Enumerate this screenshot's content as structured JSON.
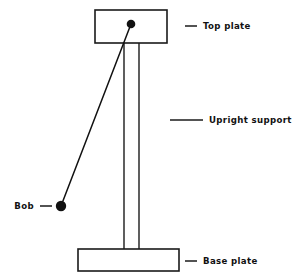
{
  "diagram": {
    "background_color": "#ffffff",
    "line_color": "#1a1a1a",
    "text_color": "#111111",
    "labels": {
      "top_plate": "Top plate",
      "upright_support": "Upright support",
      "base_plate": "Base plate",
      "bob": "Bob"
    },
    "geometry": {
      "top_plate": {
        "x": 95,
        "y": 10,
        "width": 72,
        "height": 33
      },
      "base_plate": {
        "x": 78,
        "y": 249,
        "width": 101,
        "height": 22
      },
      "upright_left_x": 124,
      "upright_right_x": 139,
      "upright_top_y": 43,
      "upright_bottom_y": 249,
      "pivot": {
        "x": 131,
        "y": 24,
        "r": 4.3
      },
      "bob": {
        "x": 61,
        "y": 206,
        "r": 5.2
      },
      "string": {
        "x1": 131,
        "y1": 24,
        "x2": 61,
        "y2": 206
      }
    },
    "leaders": {
      "top_plate": {
        "x1": 185,
        "y1": 26,
        "x2": 197,
        "y2": 26,
        "text_x": 203,
        "text_y": 29
      },
      "upright_support": {
        "x1": 170,
        "y1": 120,
        "x2": 203,
        "y2": 120,
        "text_x": 209,
        "text_y": 123
      },
      "base_plate": {
        "x1": 185,
        "y1": 261,
        "x2": 197,
        "y2": 261,
        "text_x": 203,
        "text_y": 264
      },
      "bob": {
        "x1": 40,
        "y1": 206,
        "x2": 52,
        "y2": 206,
        "text_x": 34,
        "text_y": 209
      }
    }
  }
}
